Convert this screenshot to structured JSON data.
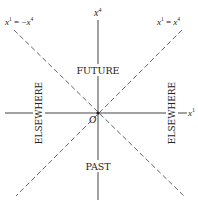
{
  "diagram": {
    "type": "spacetime light-cone diagram",
    "axes": {
      "vertical": {
        "label": "x",
        "sup": "4"
      },
      "horizontal": {
        "label": "x",
        "sup": "1"
      }
    },
    "origin_label": "O",
    "light_lines": {
      "left": {
        "lhs": "x",
        "lhs_sup": "1",
        "eq": " = −",
        "rhs": "x",
        "rhs_sup": "4"
      },
      "right": {
        "lhs": "x",
        "lhs_sup": "1",
        "eq": " = ",
        "rhs": "x",
        "rhs_sup": "4"
      }
    },
    "regions": {
      "future": "FUTURE",
      "past": "PAST",
      "elsewhere_left": "ELSEWHERE",
      "elsewhere_right": "ELSEWHERE"
    },
    "colors": {
      "line": "#333333",
      "background": "#ffffff"
    }
  }
}
